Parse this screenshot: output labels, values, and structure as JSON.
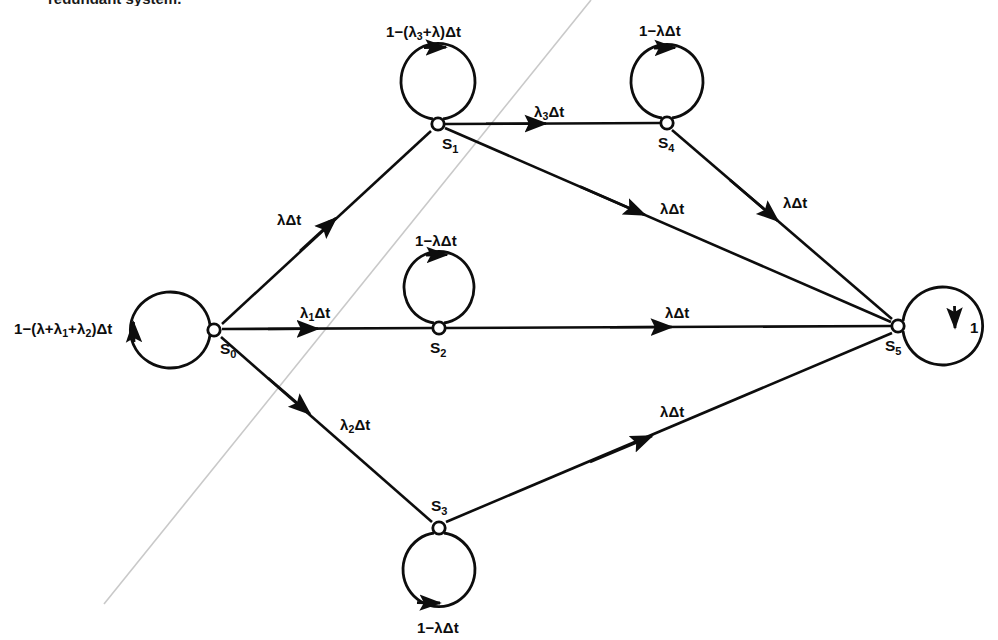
{
  "figure": {
    "kind": "state-transition-diagram",
    "caption_clipped": "redundant system.",
    "background": "#ffffff",
    "ink": "#0d0d0d",
    "artifact_color": "#c9c9c9"
  },
  "nodes": [
    {
      "id": "S0",
      "label": "S",
      "sub": "0",
      "x": 214,
      "y": 330,
      "label_dx": 6,
      "label_dy": 11
    },
    {
      "id": "S1",
      "label": "S",
      "sub": "1",
      "x": 438,
      "y": 124,
      "label_dx": 4,
      "label_dy": 12
    },
    {
      "id": "S2",
      "label": "S",
      "sub": "2",
      "x": 439,
      "y": 328,
      "label_dx": -9,
      "label_dy": 12
    },
    {
      "id": "S3",
      "label": "S",
      "sub": "3",
      "x": 439,
      "y": 528,
      "label_dx": -8,
      "label_dy": -30
    },
    {
      "id": "S4",
      "label": "S",
      "sub": "4",
      "x": 667,
      "y": 123,
      "label_dx": -9,
      "label_dy": 12
    },
    {
      "id": "S5",
      "label": "S",
      "sub": "5",
      "x": 898,
      "y": 326,
      "label_dx": -13,
      "label_dy": 12
    }
  ],
  "edges": [
    {
      "id": "e-s0-s1",
      "from": "S0",
      "to": "S1",
      "label": "λΔt",
      "label_x": 277,
      "label_y": 212
    },
    {
      "id": "e-s0-s2",
      "from": "S0",
      "to": "S2",
      "label": "λ",
      "sub": "1",
      "label_tail": "Δt",
      "label_x": 300,
      "label_y": 305
    },
    {
      "id": "e-s0-s3",
      "from": "S0",
      "to": "S3",
      "label": "λ",
      "sub": "2",
      "label_tail": "Δt",
      "label_x": 340,
      "label_y": 417
    },
    {
      "id": "e-s1-s4",
      "from": "S1",
      "to": "S4",
      "label": "λ",
      "sub": "3",
      "label_tail": "Δt",
      "label_x": 534,
      "label_y": 104
    },
    {
      "id": "e-s1-s5",
      "from": "S1",
      "to": "S5",
      "label": "λΔt",
      "label_x": 660,
      "label_y": 201
    },
    {
      "id": "e-s2-s5",
      "from": "S2",
      "to": "S5",
      "label": "λΔt",
      "label_x": 665,
      "label_y": 305
    },
    {
      "id": "e-s3-s5",
      "from": "S3",
      "to": "S5",
      "label": "λΔt",
      "label_x": 660,
      "label_y": 404
    },
    {
      "id": "e-s4-s5",
      "from": "S4",
      "to": "S5",
      "label": "λΔt",
      "label_x": 783,
      "label_y": 195
    }
  ],
  "self_loops": [
    {
      "id": "loop-s0",
      "node": "S0",
      "side": "left",
      "label_prefix": "1−(λ+λ",
      "label_sub1": "1",
      "label_mid": "+λ",
      "label_sub2": "2",
      "label_suffix": ")Δt",
      "label_x": 14,
      "label_y": 321
    },
    {
      "id": "loop-s1",
      "node": "S1",
      "side": "top",
      "label_prefix": "1−(λ",
      "label_sub1": "3",
      "label_mid": "+λ",
      "label_suffix": ")Δt",
      "label_x": 386,
      "label_y": 24
    },
    {
      "id": "loop-s2",
      "node": "S2",
      "side": "top",
      "label": "1−λΔt",
      "label_x": 415,
      "label_y": 233
    },
    {
      "id": "loop-s3",
      "node": "S3",
      "side": "bottom",
      "label": "1−λΔt",
      "label_x": 417,
      "label_y": 620
    },
    {
      "id": "loop-s4",
      "node": "S4",
      "side": "top",
      "label": "1−λΔt",
      "label_x": 639,
      "label_y": 23
    },
    {
      "id": "loop-s5",
      "node": "S5",
      "side": "right",
      "label": "1",
      "label_x": 970,
      "label_y": 320
    }
  ],
  "artifact": {
    "id": "scan-line",
    "x1": 104,
    "y1": 604,
    "x2": 591,
    "y2": 0
  }
}
